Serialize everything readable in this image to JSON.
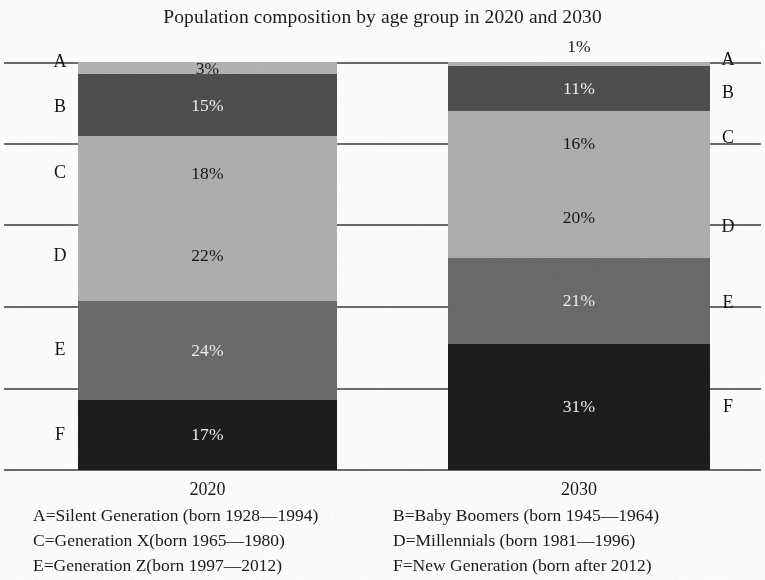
{
  "chart_data": {
    "type": "bar",
    "subtype": "stacked-bar-100-percent",
    "title": "Population composition by age group in 2020 and 2030",
    "xlabel": "",
    "ylabel": "",
    "categories": [
      "2020",
      "2030"
    ],
    "ylim": [
      0,
      100
    ],
    "grid": true,
    "orientation": "vertical",
    "stack_order": "A at top to F at bottom",
    "legend_position": "below-plot",
    "value_suffix": "%",
    "series": [
      {
        "name": "A",
        "values": [
          3,
          1
        ]
      },
      {
        "name": "B",
        "values": [
          15,
          11
        ]
      },
      {
        "name": "C",
        "values": [
          18,
          16
        ]
      },
      {
        "name": "D",
        "values": [
          22,
          20
        ]
      },
      {
        "name": "E",
        "values": [
          24,
          21
        ]
      },
      {
        "name": "F",
        "values": [
          17,
          31
        ]
      }
    ],
    "colors": {
      "A": "#b4b4b4",
      "B": "#4f4f4f",
      "C": "#b0b0b0",
      "D": "#b0b0b0",
      "E": "#6b6b6b",
      "F": "#1d1d1d"
    },
    "bars": [
      {
        "category": "2020",
        "tick_label": "2020",
        "segments": [
          {
            "group": "A",
            "value": 3,
            "data_label": "3%",
            "label_placement": "inside",
            "label_color": "dark",
            "fill": "#b4b4b4"
          },
          {
            "group": "B",
            "value": 15,
            "data_label": "15%",
            "label_placement": "inside",
            "label_color": "light",
            "fill": "#4f4f4f"
          },
          {
            "group": "C",
            "value": 18,
            "data_label": "18%",
            "label_placement": "inside",
            "label_color": "dark",
            "fill": "#b0b0b0"
          },
          {
            "group": "D",
            "value": 22,
            "data_label": "22%",
            "label_placement": "inside",
            "label_color": "dark",
            "fill": "#b0b0b0"
          },
          {
            "group": "E",
            "value": 24,
            "data_label": "24%",
            "label_placement": "inside",
            "label_color": "light",
            "fill": "#6b6b6b"
          },
          {
            "group": "F",
            "value": 17,
            "data_label": "17%",
            "label_placement": "inside",
            "label_color": "light",
            "fill": "#1d1d1d"
          }
        ]
      },
      {
        "category": "2030",
        "tick_label": "2030",
        "segments": [
          {
            "group": "A",
            "value": 1,
            "data_label": "1%",
            "label_placement": "above",
            "label_color": "dark",
            "fill": "#b4b4b4"
          },
          {
            "group": "B",
            "value": 11,
            "data_label": "11%",
            "label_placement": "inside",
            "label_color": "light",
            "fill": "#4f4f4f"
          },
          {
            "group": "C",
            "value": 16,
            "data_label": "16%",
            "label_placement": "inside",
            "label_color": "dark",
            "fill": "#b0b0b0"
          },
          {
            "group": "D",
            "value": 20,
            "data_label": "20%",
            "label_placement": "inside",
            "label_color": "dark",
            "fill": "#b0b0b0"
          },
          {
            "group": "E",
            "value": 21,
            "data_label": "21%",
            "label_placement": "inside",
            "label_color": "light",
            "fill": "#6b6b6b"
          },
          {
            "group": "F",
            "value": 31,
            "data_label": "31%",
            "label_placement": "inside",
            "label_color": "light",
            "fill": "#1d1d1d"
          }
        ]
      }
    ],
    "axis_labels_left": [
      "A",
      "B",
      "C",
      "D",
      "E",
      "F"
    ],
    "axis_labels_right": [
      "A",
      "B",
      "C",
      "D",
      "E",
      "F"
    ],
    "legend": [
      {
        "key": "A",
        "text": "A=Silent Generation (born 1928—1994)"
      },
      {
        "key": "B",
        "text": "B=Baby Boomers (born 1945—1964)"
      },
      {
        "key": "C",
        "text": "C=Generation X(born 1965—1980)"
      },
      {
        "key": "D",
        "text": "D=Millennials (born 1981—1996)"
      },
      {
        "key": "E",
        "text": "E=Generation Z(born 1997—2012)"
      },
      {
        "key": "F",
        "text": "F=New Generation (born after 2012)"
      }
    ]
  }
}
